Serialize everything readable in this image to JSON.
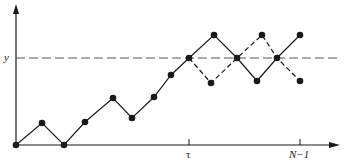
{
  "diagram": {
    "labels": {
      "y_level": "y",
      "tau": "τ",
      "n_minus_1": "N−1"
    },
    "colors": {
      "ink": "#1a1a1a",
      "dashed_line": "#555555",
      "background": "#ffffff"
    },
    "axes": {
      "origin": [
        16,
        145
      ],
      "x_end": 340,
      "y_top": 4,
      "y_level_pixel": 58,
      "tau_tick_x": 189,
      "n_minus_1_tick_x": 300
    },
    "solid_path": [
      [
        16,
        145
      ],
      [
        42,
        123
      ],
      [
        64,
        145
      ],
      [
        85,
        122
      ],
      [
        113,
        98
      ],
      [
        132,
        118
      ],
      [
        154,
        97
      ],
      [
        171,
        75
      ],
      [
        189,
        58
      ],
      [
        214,
        35
      ],
      [
        237,
        58
      ],
      [
        257,
        81
      ],
      [
        277,
        58
      ],
      [
        300,
        35
      ]
    ],
    "dashed_reflected_path": [
      [
        189,
        58
      ],
      [
        211,
        83
      ],
      [
        237,
        58
      ],
      [
        262,
        35
      ],
      [
        277,
        58
      ],
      [
        300,
        81
      ]
    ]
  }
}
